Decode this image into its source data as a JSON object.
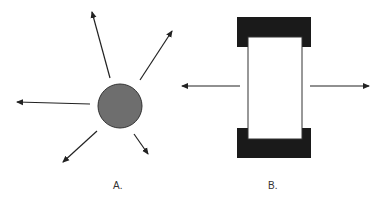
{
  "diagram": {
    "panels": [
      {
        "id": "A",
        "label": "A.",
        "shape": "circle",
        "description": "Sphere with arrows radiating in all directions",
        "circle": {
          "cx": 120,
          "cy": 106,
          "r": 22,
          "fill": "#6e6e6e",
          "stroke": "#333333"
        },
        "arrows": [
          {
            "name": "up",
            "x1": 110,
            "y1": 78,
            "x2": 92,
            "y2": 12
          },
          {
            "name": "up-right",
            "x1": 140,
            "y1": 80,
            "x2": 172,
            "y2": 31
          },
          {
            "name": "left",
            "x1": 90,
            "y1": 104,
            "x2": 17,
            "y2": 102
          },
          {
            "name": "down-left",
            "x1": 97,
            "y1": 131,
            "x2": 63,
            "y2": 162
          },
          {
            "name": "down-right",
            "x1": 134,
            "y1": 134,
            "x2": 148,
            "y2": 154
          }
        ]
      },
      {
        "id": "B",
        "label": "B.",
        "shape": "rectangle-with-end-caps",
        "description": "Rectangle capped by dark blocks, arrows pointing left and right",
        "arrows": [
          {
            "name": "left",
            "x1": 240,
            "y1": 86,
            "x2": 182,
            "y2": 86
          },
          {
            "name": "right",
            "x1": 310,
            "y1": 86,
            "x2": 369,
            "y2": 86
          }
        ]
      }
    ],
    "colors": {
      "arrow": "#222222",
      "circle_fill": "#6e6e6e",
      "cap_fill": "#1a1a1a",
      "label": "#333333"
    }
  }
}
